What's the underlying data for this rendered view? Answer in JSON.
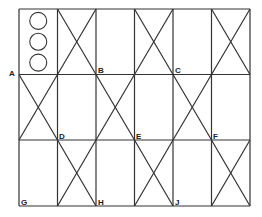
{
  "grid": {
    "cols": [
      19,
      57.5,
      96,
      134.5,
      173,
      211.5,
      250
    ],
    "rows": [
      9,
      74.5,
      140,
      206
    ],
    "line_color": "#333333",
    "crossed_cells": [
      [
        0,
        1
      ],
      [
        0,
        3
      ],
      [
        0,
        5
      ],
      [
        1,
        0
      ],
      [
        1,
        2
      ],
      [
        1,
        4
      ],
      [
        2,
        1
      ],
      [
        2,
        3
      ],
      [
        2,
        5
      ]
    ],
    "circle_cell": [
      0,
      0
    ],
    "circle_count": 3
  },
  "labels": [
    {
      "id": "A",
      "text": "A",
      "x": 9,
      "y": 70
    },
    {
      "id": "B",
      "text": "B",
      "x": 98,
      "y": 67
    },
    {
      "id": "C",
      "text": "C",
      "x": 175,
      "y": 67
    },
    {
      "id": "D",
      "text": "D",
      "x": 59,
      "y": 133
    },
    {
      "id": "E",
      "text": "E",
      "x": 136,
      "y": 133
    },
    {
      "id": "F",
      "text": "F",
      "x": 213,
      "y": 133
    },
    {
      "id": "G",
      "text": "G",
      "x": 21,
      "y": 199
    },
    {
      "id": "H",
      "text": "H",
      "x": 98,
      "y": 199
    },
    {
      "id": "J",
      "text": "J",
      "x": 175,
      "y": 199
    }
  ]
}
